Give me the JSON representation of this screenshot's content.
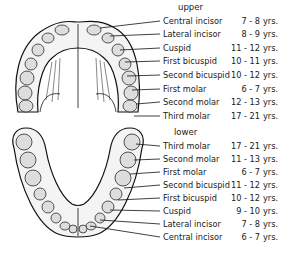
{
  "upper": {
    "title": "upper",
    "teeth": [
      {
        "name": "Central incisor",
        "age": "7 - 8",
        "unit": "yrs."
      },
      {
        "name": "Lateral incisor",
        "age": "8 - 9",
        "unit": "yrs."
      },
      {
        "name": "Cuspid",
        "age": "11 - 12",
        "unit": "yrs."
      },
      {
        "name": "First bicuspid",
        "age": "10 - 11",
        "unit": "yrs."
      },
      {
        "name": "Second bicuspid",
        "age": "10 - 12",
        "unit": "yrs."
      },
      {
        "name": "First molar",
        "age": "6 - 7",
        "unit": "yrs."
      },
      {
        "name": "Second molar",
        "age": "12 - 13",
        "unit": "yrs."
      },
      {
        "name": "Third molar",
        "age": "17 - 21",
        "unit": "yrs."
      }
    ]
  },
  "lower": {
    "title": "lower",
    "teeth": [
      {
        "name": "Third molar",
        "age": "17 - 21",
        "unit": "yrs."
      },
      {
        "name": "Second molar",
        "age": "11 - 13",
        "unit": "yrs."
      },
      {
        "name": "First molar",
        "age": "6 - 7",
        "unit": "yrs."
      },
      {
        "name": "Second bicuspid",
        "age": "11 - 12",
        "unit": "yrs."
      },
      {
        "name": "First bicuspid",
        "age": "10 - 12",
        "unit": "yrs."
      },
      {
        "name": "Cuspid",
        "age": "9 - 10",
        "unit": "yrs."
      },
      {
        "name": "Lateral incisor",
        "age": "7 - 8",
        "unit": "yrs."
      },
      {
        "name": "Central incisor",
        "age": "6 - 7",
        "unit": "yrs."
      }
    ]
  }
}
